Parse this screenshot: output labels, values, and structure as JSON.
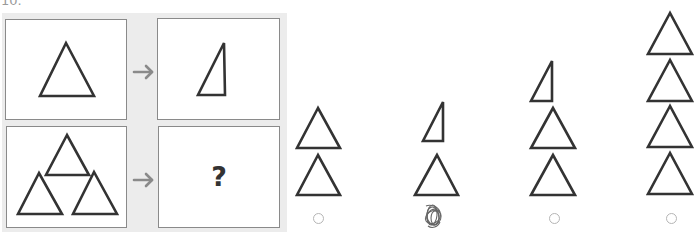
{
  "question": {
    "number": "10.",
    "missing_symbol": "?"
  },
  "stimulus": {
    "rows": [
      {
        "input": "one equilateral triangle",
        "arrow": "right-arrow-icon",
        "output": "one right triangle"
      },
      {
        "input": "three equilateral triangles (pyramid)",
        "arrow": "right-arrow-icon",
        "output": "?"
      }
    ]
  },
  "options": [
    {
      "id": 1,
      "figure": "two equilateral triangles stacked",
      "selected": false
    },
    {
      "id": 2,
      "figure": "right triangle above one equilateral triangle",
      "selected": true
    },
    {
      "id": 3,
      "figure": "right triangle above two equilateral triangles",
      "selected": false
    },
    {
      "id": 4,
      "figure": "four equilateral triangles stacked",
      "selected": false
    }
  ],
  "colors": {
    "stroke": "#333333",
    "panel": "#ececec",
    "cell_border": "#8a8a8a",
    "arrow": "#8a8a8a",
    "radio": "#b5b5b5",
    "scribble": "#666666"
  }
}
